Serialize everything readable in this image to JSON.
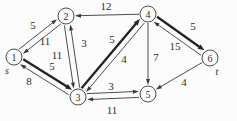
{
  "figure": {
    "width": 237,
    "height": 121,
    "background_color": "#fcfcfc",
    "ink_color": "#3a3a3a",
    "bold_ink_color": "#222222",
    "node_fill": "#fcfcfc",
    "node_radius": 8,
    "nodes": [
      {
        "id": "1",
        "x": 14,
        "y": 57,
        "tag": "s",
        "tag_x": 7,
        "tag_y": 70
      },
      {
        "id": "2",
        "x": 66,
        "y": 16
      },
      {
        "id": "3",
        "x": 78,
        "y": 97
      },
      {
        "id": "4",
        "x": 148,
        "y": 14
      },
      {
        "id": "5",
        "x": 148,
        "y": 94
      },
      {
        "id": "6",
        "x": 210,
        "y": 58,
        "tag": "t",
        "tag_x": 217,
        "tag_y": 71
      }
    ],
    "edges": [
      {
        "from": "1",
        "to": "2",
        "weight": 5,
        "bold": false,
        "offset": -3,
        "label_x": 33,
        "label_y": 25
      },
      {
        "from": "2",
        "to": "1",
        "weight": 11,
        "bold": false,
        "offset": -3,
        "label_x": 45,
        "label_y": 41
      },
      {
        "from": "1",
        "to": "3",
        "weight": 5,
        "bold": true,
        "offset": -3,
        "label_x": 52,
        "label_y": 66
      },
      {
        "from": "3",
        "to": "1",
        "weight": 8,
        "bold": false,
        "offset": -3,
        "label_x": 29,
        "label_y": 81
      },
      {
        "from": "3",
        "to": "2",
        "weight": 3,
        "bold": false,
        "offset": 3,
        "label_x": 84,
        "label_y": 43
      },
      {
        "from": "2",
        "to": "3",
        "weight": 11,
        "bold": false,
        "offset": 3,
        "label_x": 57,
        "label_y": 55
      },
      {
        "from": "4",
        "to": "2",
        "weight": 12,
        "bold": false,
        "offset": 0,
        "label_x": 106,
        "label_y": 6
      },
      {
        "from": "3",
        "to": "4",
        "weight": 5,
        "bold": true,
        "offset": -3,
        "label_x": 112,
        "label_y": 39
      },
      {
        "from": "4",
        "to": "3",
        "weight": 4,
        "bold": false,
        "offset": -3,
        "label_x": 124,
        "label_y": 59
      },
      {
        "from": "4",
        "to": "5",
        "weight": 7,
        "bold": false,
        "offset": 0,
        "label_x": 156,
        "label_y": 57
      },
      {
        "from": "4",
        "to": "6",
        "weight": 5,
        "bold": true,
        "offset": -3,
        "label_x": 193,
        "label_y": 26
      },
      {
        "from": "6",
        "to": "4",
        "weight": 15,
        "bold": false,
        "offset": -3,
        "label_x": 175,
        "label_y": 46
      },
      {
        "from": "3",
        "to": "5",
        "weight": 3,
        "bold": false,
        "offset": -3,
        "label_x": 111,
        "label_y": 86
      },
      {
        "from": "5",
        "to": "3",
        "weight": 11,
        "bold": false,
        "offset": -3,
        "label_x": 112,
        "label_y": 110
      },
      {
        "from": "6",
        "to": "5",
        "weight": 4,
        "bold": false,
        "offset": 0,
        "label_x": 184,
        "label_y": 82
      }
    ]
  }
}
